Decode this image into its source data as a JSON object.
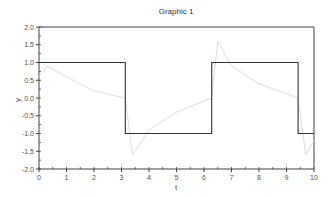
{
  "chart_data": {
    "type": "line",
    "title": "Graphic 1",
    "xlabel": "t",
    "ylabel": "y",
    "xlim": [
      0,
      10
    ],
    "ylim": [
      -2.0,
      2.0
    ],
    "x_ticks": [
      "0",
      "1",
      "2",
      "3",
      "4",
      "5",
      "6",
      "7",
      "8",
      "9",
      "10"
    ],
    "y_ticks": [
      "2.0",
      "1.5",
      "1.0",
      "0.5",
      "0.0",
      "-0.5",
      "-1.0",
      "-1.5",
      "-2.0"
    ],
    "grid": false,
    "legend": null,
    "series": [
      {
        "name": "square wave",
        "color": "#333333",
        "x": [
          0,
          3.14,
          3.14,
          6.28,
          6.28,
          9.42,
          9.42,
          10
        ],
        "y": [
          1,
          1,
          -1,
          -1,
          1,
          1,
          -1,
          -1
        ]
      },
      {
        "name": "response",
        "color": "#dddddd",
        "x": [
          0,
          0.3,
          1,
          2,
          3.14,
          3.4,
          4,
          5,
          6.28,
          6.5,
          7,
          8,
          9.42,
          9.7,
          10
        ],
        "y": [
          0.6,
          0.9,
          0.6,
          0.2,
          0.0,
          -1.6,
          -0.9,
          -0.4,
          0.0,
          1.6,
          0.9,
          0.4,
          0.0,
          -1.6,
          -1.2
        ]
      }
    ]
  }
}
